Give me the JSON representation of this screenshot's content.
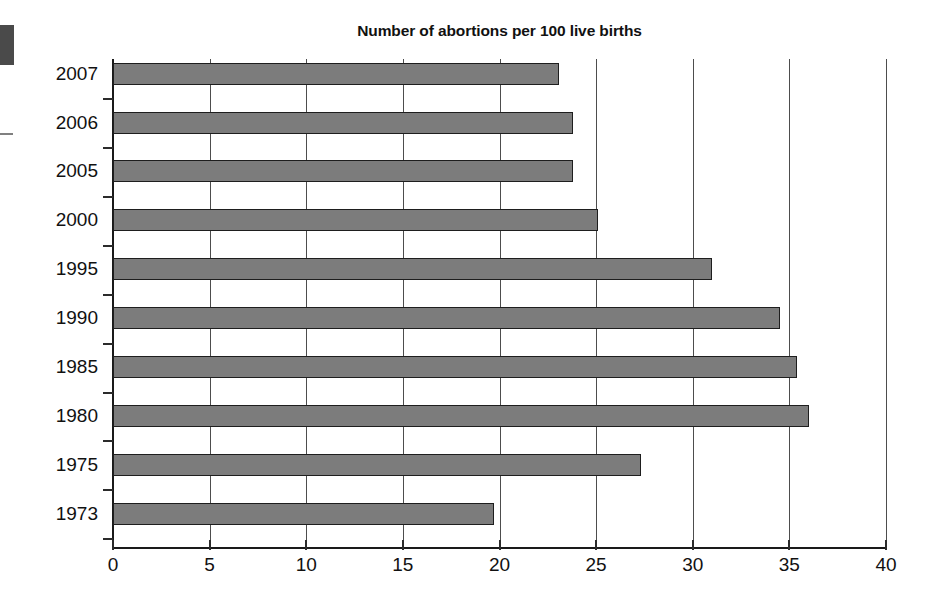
{
  "chart_data": {
    "type": "bar",
    "orientation": "horizontal",
    "title": "Number of abortions per 100 live births",
    "xlabel": "",
    "ylabel": "",
    "categories": [
      "2007",
      "2006",
      "2005",
      "2000",
      "1995",
      "1990",
      "1985",
      "1980",
      "1975",
      "1973"
    ],
    "values": [
      23.1,
      23.8,
      23.8,
      25.1,
      31.0,
      34.5,
      35.4,
      36.0,
      27.3,
      19.7
    ],
    "xlim": [
      0,
      40
    ],
    "xticks": [
      0,
      5,
      10,
      15,
      20,
      25,
      30,
      35,
      40
    ],
    "xticklabels": [
      "0",
      "5",
      "10",
      "15",
      "20",
      "25",
      "30",
      "35",
      "40"
    ],
    "grid": true,
    "grid_axis": "x",
    "legend": null,
    "bar_color": "#7c7c7c",
    "bar_edge_color": "#1e1e1e",
    "axis_color": "#1a1a1a",
    "background": "#ffffff"
  },
  "artifacts": {
    "scan_block_label": "scan-artifact-block",
    "scan_dash_label": "scan-artifact-dash"
  }
}
